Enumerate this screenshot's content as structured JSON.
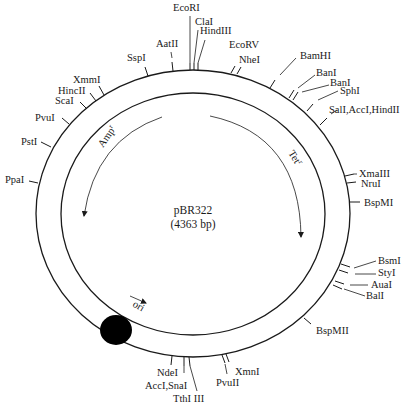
{
  "plasmid": {
    "name": "pBR322",
    "size_label": "(4363 bp)"
  },
  "geometry": {
    "outer": {
      "cx": 193,
      "cy": 213.5,
      "rx": 157,
      "ry": 143.5
    },
    "inner": {
      "cx": 193,
      "cy": 214,
      "rx": 132,
      "ry": 121
    },
    "line_color": "#1a1a1a"
  },
  "genes": [
    {
      "label": "Amp",
      "sup": "r",
      "text_x": 103,
      "text_y": 148,
      "rotate": -55,
      "path": "M162,117 Q95,140 84,216"
    },
    {
      "label": "Tet",
      "sup": "r",
      "text_x": 288,
      "text_y": 153,
      "rotate": 58,
      "path": "M210,116 Q300,135 301,237"
    },
    {
      "label": "ori",
      "sup": "",
      "text_x": 132,
      "text_y": 306,
      "rotate": 30,
      "path": "M130,296 L146,303"
    }
  ],
  "ori_blob": {
    "cx": 116,
    "cy": 330,
    "rx": 16,
    "ry": 15,
    "color": "#000000"
  },
  "sites": [
    {
      "label": "EcoRI",
      "tick": [
        [
          190,
          70
        ],
        [
          190,
          63
        ]
      ],
      "leader": [
        [
          190,
          63
        ],
        [
          190,
          16
        ]
      ],
      "lx": 173,
      "ly": 11,
      "anchor": "start"
    },
    {
      "label": "ClaI",
      "tick": [
        [
          194,
          70
        ],
        [
          194,
          63
        ]
      ],
      "leader": [
        [
          194,
          63
        ],
        [
          198,
          30
        ]
      ],
      "lx": 195,
      "ly": 25,
      "anchor": "start"
    },
    {
      "label": "HindIII",
      "tick": [
        [
          198,
          70
        ],
        [
          198,
          63
        ]
      ],
      "leader": [
        [
          198,
          63
        ],
        [
          205,
          40
        ]
      ],
      "lx": 200,
      "ly": 34,
      "anchor": "start"
    },
    {
      "label": "AatII",
      "tick": [
        [
          173,
          71
        ],
        [
          172,
          62
        ]
      ],
      "leader": [
        [
          172,
          58
        ],
        [
          171,
          52
        ]
      ],
      "lx": 156,
      "ly": 47,
      "anchor": "start"
    },
    {
      "label": "SspI",
      "tick": [
        [
          148,
          76
        ],
        [
          145,
          67
        ]
      ],
      "leader": [],
      "lx": 127,
      "ly": 61,
      "anchor": "start"
    },
    {
      "label": "EcoRV",
      "tick": [
        [
          231,
          73
        ],
        [
          235,
          66
        ]
      ],
      "leader": [],
      "lx": 229,
      "ly": 48,
      "anchor": "start"
    },
    {
      "label": "NheI",
      "tick": [
        [
          237,
          74
        ],
        [
          241,
          67
        ]
      ],
      "leader": [],
      "lx": 239,
      "ly": 63,
      "anchor": "start"
    },
    {
      "label": "BamHI",
      "tick": [
        [
          270,
          88
        ],
        [
          275,
          80
        ]
      ],
      "leader": [
        [
          280,
          75
        ],
        [
          296,
          58
        ]
      ],
      "lx": 300,
      "ly": 59,
      "anchor": "start"
    },
    {
      "label": "BanI",
      "tick": [
        [
          289,
          98
        ],
        [
          294,
          90
        ]
      ],
      "leader": [
        [
          298,
          88
        ],
        [
          315,
          75
        ]
      ],
      "lx": 316,
      "ly": 76,
      "anchor": "start"
    },
    {
      "label": "BanI",
      "tick": [
        [
          293,
          100
        ],
        [
          298,
          92
        ]
      ],
      "leader": [
        [
          302,
          92
        ],
        [
          329,
          85
        ]
      ],
      "lx": 330,
      "ly": 86,
      "anchor": "start"
    },
    {
      "label": "SphI",
      "tick": [
        [
          307,
          111
        ],
        [
          313,
          104
        ]
      ],
      "leader": [
        [
          318,
          100
        ],
        [
          338,
          91
        ]
      ],
      "lx": 340,
      "ly": 94,
      "anchor": "start"
    },
    {
      "label": "SalI,AccI,HindII",
      "tick": [
        [
          320,
          125
        ],
        [
          327,
          118
        ]
      ],
      "leader": [
        [
          331,
          114
        ],
        [
          337,
          110
        ]
      ],
      "lx": 329,
      "ly": 113,
      "anchor": "start"
    },
    {
      "label": "XmaIII",
      "tick": [
        [
          345,
          176
        ],
        [
          354,
          174
        ]
      ],
      "leader": [
        [
          354,
          174
        ],
        [
          357,
          174
        ]
      ],
      "lx": 359,
      "ly": 177,
      "anchor": "start"
    },
    {
      "label": "NruI",
      "tick": [
        [
          347,
          183
        ],
        [
          356,
          182
        ]
      ],
      "leader": [],
      "lx": 361,
      "ly": 187,
      "anchor": "start"
    },
    {
      "label": "BspMI",
      "tick": [
        [
          350,
          202
        ],
        [
          360,
          202
        ]
      ],
      "leader": [],
      "lx": 364,
      "ly": 206,
      "anchor": "start"
    },
    {
      "label": "BsmI",
      "tick": [
        [
          341,
          264
        ],
        [
          350,
          267
        ]
      ],
      "leader": [
        [
          354,
          268
        ],
        [
          376,
          261
        ]
      ],
      "lx": 378,
      "ly": 264,
      "anchor": "start"
    },
    {
      "label": "StyI",
      "tick": [
        [
          339,
          270
        ],
        [
          348,
          273
        ]
      ],
      "leader": [
        [
          355,
          274
        ],
        [
          376,
          274
        ]
      ],
      "lx": 378,
      "ly": 276,
      "anchor": "start"
    },
    {
      "label": "AuaI",
      "tick": [
        [
          335,
          281
        ],
        [
          344,
          284
        ]
      ],
      "leader": [
        [
          350,
          285
        ],
        [
          368,
          285
        ]
      ],
      "lx": 371,
      "ly": 288,
      "anchor": "start"
    },
    {
      "label": "BalI",
      "tick": [
        [
          333,
          285
        ],
        [
          342,
          289
        ]
      ],
      "leader": [
        [
          344,
          289
        ],
        [
          365,
          296
        ]
      ],
      "lx": 366,
      "ly": 299,
      "anchor": "start"
    },
    {
      "label": "BspMII",
      "tick": [
        [
          304,
          318
        ],
        [
          311,
          324
        ]
      ],
      "leader": [],
      "lx": 316,
      "ly": 334,
      "anchor": "start"
    },
    {
      "label": "XmnI",
      "tick": [
        [
          226,
          354
        ],
        [
          229,
          362
        ]
      ],
      "leader": [],
      "lx": 235,
      "ly": 375,
      "anchor": "start"
    },
    {
      "label": "PvuII",
      "tick": [
        [
          222,
          355
        ],
        [
          225,
          363
        ]
      ],
      "leader": [
        [
          225,
          364
        ],
        [
          227,
          374
        ]
      ],
      "lx": 216,
      "ly": 386,
      "anchor": "start"
    },
    {
      "label": "NdeI",
      "tick": [
        [
          172,
          356
        ],
        [
          171,
          365
        ]
      ],
      "leader": [],
      "lx": 157,
      "ly": 376,
      "anchor": "start"
    },
    {
      "label": "AccI,SnaI",
      "tick": [
        [
          184,
          357
        ],
        [
          184,
          366
        ]
      ],
      "leader": [
        [
          184,
          366
        ],
        [
          184,
          373
        ]
      ],
      "lx": 145,
      "ly": 389,
      "anchor": "start"
    },
    {
      "label": "TthI III",
      "tick": [
        [
          189,
          357
        ],
        [
          190,
          366
        ]
      ],
      "leader": [
        [
          190,
          366
        ],
        [
          197,
          391
        ]
      ],
      "lx": 173,
      "ly": 402,
      "anchor": "start"
    },
    {
      "label": "XmmI",
      "tick": [
        [
          104,
          95
        ],
        [
          99,
          86
        ]
      ],
      "leader": [],
      "lx": 73,
      "ly": 83,
      "anchor": "start"
    },
    {
      "label": "HincII",
      "tick": [
        [
          96,
          101
        ],
        [
          90,
          93
        ]
      ],
      "leader": [],
      "lx": 58,
      "ly": 94,
      "anchor": "start"
    },
    {
      "label": "ScaI",
      "tick": [
        [
          87,
          109
        ],
        [
          80,
          102
        ]
      ],
      "leader": [],
      "lx": 55,
      "ly": 104,
      "anchor": "start"
    },
    {
      "label": "PvuI",
      "tick": [
        [
          69,
          124
        ],
        [
          62,
          118
        ]
      ],
      "leader": [],
      "lx": 35,
      "ly": 121,
      "anchor": "start"
    },
    {
      "label": "PstI",
      "tick": [
        [
          51,
          147
        ],
        [
          41,
          142
        ]
      ],
      "leader": [],
      "lx": 21,
      "ly": 145,
      "anchor": "start"
    },
    {
      "label": "PpaI",
      "tick": [
        [
          38,
          183
        ],
        [
          29,
          181
        ]
      ],
      "leader": [],
      "lx": 5,
      "ly": 183,
      "anchor": "start"
    }
  ]
}
